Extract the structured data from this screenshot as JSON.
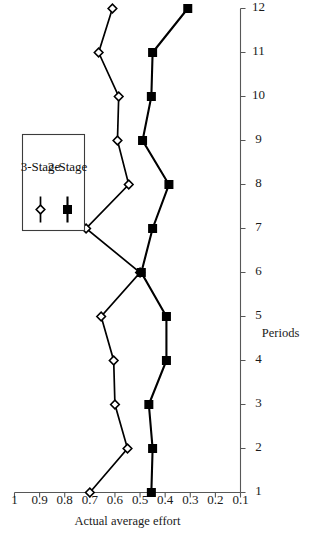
{
  "chart_data": {
    "type": "line",
    "title": "",
    "xlabel": "Periods",
    "ylabel": "Actual average effort",
    "x": [
      1,
      2,
      3,
      4,
      5,
      6,
      7,
      8,
      9,
      10,
      11,
      12
    ],
    "xticklabels": [
      "1",
      "2",
      "3",
      "4",
      "5",
      "6",
      "7",
      "8",
      "9",
      "10",
      "11",
      "12"
    ],
    "yticklabels": [
      "1",
      "0.9",
      "0.8",
      "0.7",
      "0.6",
      "0.5",
      "0.4",
      "0.3",
      "0.2",
      "0.1"
    ],
    "yticks": [
      1,
      0.9,
      0.8,
      0.7,
      0.6,
      0.5,
      0.4,
      0.3,
      0.2,
      0.1
    ],
    "ylim": [
      0.1,
      1
    ],
    "xlim": [
      1,
      12
    ],
    "grid": false,
    "rotation_degrees": -90,
    "legend_position": "top-right",
    "series": [
      {
        "name": "3-Stage",
        "marker": "open-diamond",
        "color": "#000000",
        "values": [
          0.7,
          0.55,
          0.6,
          0.605,
          0.655,
          0.5,
          0.715,
          0.545,
          0.59,
          0.585,
          0.665,
          0.61
        ]
      },
      {
        "name": "2-Stage",
        "marker": "filled-square",
        "color": "#000000",
        "values": [
          0.455,
          0.45,
          0.465,
          0.395,
          0.395,
          0.495,
          0.45,
          0.385,
          0.49,
          0.455,
          0.45,
          0.31
        ]
      }
    ]
  },
  "legend": {
    "entries": [
      {
        "label": "3-Stage",
        "marker": "open-diamond"
      },
      {
        "label": "2-Stage",
        "marker": "filled-square"
      }
    ]
  },
  "axes": {
    "x_title": "Periods",
    "y_title": "Actual average effort"
  }
}
